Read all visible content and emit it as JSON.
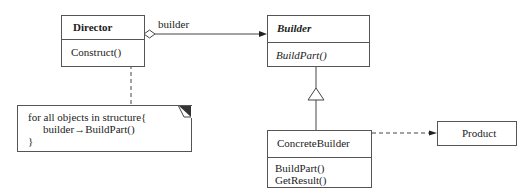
{
  "diagram": {
    "type": "UML class diagram (Builder pattern)",
    "classes": {
      "director": {
        "name": "Director",
        "operations": [
          "Construct()"
        ]
      },
      "builder": {
        "name": "Builder",
        "abstract": true,
        "operations": [
          "BuildPart()"
        ]
      },
      "concrete_builder": {
        "name": "ConcreteBuilder",
        "operations": [
          "BuildPart()",
          "GetResult()"
        ]
      },
      "product": {
        "name": "Product"
      }
    },
    "relations": {
      "aggregation_label": "builder"
    },
    "note": {
      "lines": [
        "for all objects in structure{",
        "builder→BuildPart()",
        "}"
      ]
    }
  }
}
